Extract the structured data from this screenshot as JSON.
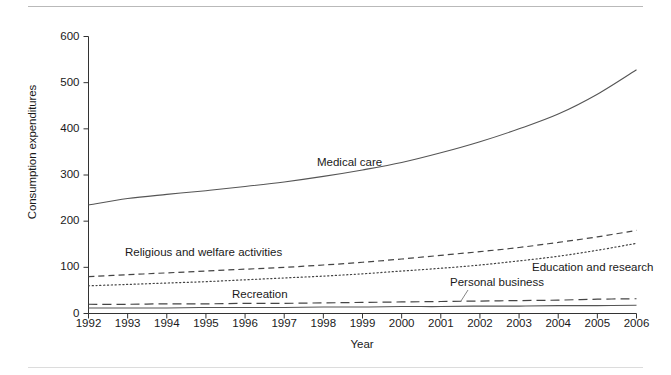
{
  "figure": {
    "background": "#ffffff",
    "rule_color": "#b9b9b9"
  },
  "chart_data": {
    "type": "line",
    "title": "",
    "xlabel": "Year",
    "ylabel": "Consumption expenditures",
    "x": [
      1992,
      1993,
      1994,
      1995,
      1996,
      1997,
      1998,
      1999,
      2000,
      2001,
      2002,
      2003,
      2004,
      2005,
      2006
    ],
    "xlim": [
      1992,
      2006
    ],
    "ylim": [
      0,
      600
    ],
    "yticks": [
      0,
      100,
      200,
      300,
      400,
      500,
      600
    ],
    "xticks": [
      "1992",
      "1993",
      "1994",
      "1995",
      "1996",
      "1997",
      "1998",
      "1999",
      "2000",
      "2001",
      "2002",
      "2003",
      "2004",
      "2005",
      "2006"
    ],
    "grid": false,
    "legend": "inline-annotations",
    "series": [
      {
        "name": "Medical care",
        "style": "solid",
        "color": "#555555",
        "values": [
          235,
          249,
          258,
          266,
          275,
          285,
          297,
          311,
          327,
          348,
          372,
          400,
          432,
          475,
          528
        ]
      },
      {
        "name": "Religious and welfare activities",
        "style": "dashed",
        "color": "#444444",
        "values": [
          80,
          84,
          88,
          92,
          96,
          100,
          105,
          111,
          118,
          126,
          134,
          143,
          154,
          166,
          180
        ]
      },
      {
        "name": "Education and research",
        "style": "dotted",
        "color": "#444444",
        "values": [
          60,
          63,
          66,
          69,
          73,
          77,
          81,
          86,
          92,
          98,
          105,
          114,
          124,
          137,
          152
        ]
      },
      {
        "name": "Recreation",
        "style": "long-dashed",
        "color": "#444444",
        "values": [
          20,
          20,
          21,
          21,
          22,
          22,
          23,
          24,
          25,
          26,
          27,
          28,
          29,
          31,
          32
        ]
      },
      {
        "name": "Personal business",
        "style": "solid",
        "color": "#555555",
        "values": [
          12,
          12,
          12,
          13,
          13,
          13,
          14,
          14,
          15,
          15,
          16,
          16,
          17,
          17,
          18
        ]
      }
    ],
    "annotations": [
      {
        "text": "Medical care",
        "x": 317,
        "y": 157
      },
      {
        "text": "Religious and welfare activities",
        "x": 125,
        "y": 247
      },
      {
        "text": "Education and research",
        "x": 532,
        "y": 262
      },
      {
        "text": "Recreation",
        "x": 232,
        "y": 289
      },
      {
        "text": "Personal business",
        "x": 450,
        "y": 277
      }
    ]
  }
}
